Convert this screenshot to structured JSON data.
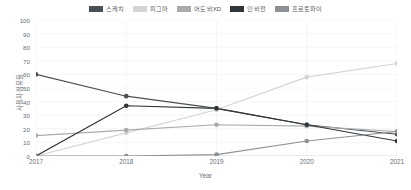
{
  "legend": {
    "position": "top-center",
    "items": [
      {
        "label": "스케치",
        "color": "#4a4f54"
      },
      {
        "label": "피그마",
        "color": "#d2d4d6"
      },
      {
        "label": "어도비XD",
        "color": "#a8acaf"
      },
      {
        "label": "인비전",
        "color": "#303539"
      },
      {
        "label": "프로토파이",
        "color": "#8d9195"
      }
    ]
  },
  "axes": {
    "x_title": "Year",
    "y_title": "사용자 점유율",
    "x_ticks": [
      "2017",
      "2018",
      "2019",
      "2020",
      "2021"
    ],
    "y_ticks": [
      "0",
      "10",
      "20",
      "30",
      "40",
      "50",
      "60",
      "70",
      "80",
      "90",
      "100"
    ]
  },
  "chart_data": {
    "type": "line",
    "title": "",
    "xlabel": "Year",
    "ylabel": "사용자 점유율",
    "x": [
      2017,
      2018,
      2019,
      2020,
      2021
    ],
    "categories": [
      "2017",
      "2018",
      "2019",
      "2020",
      "2021"
    ],
    "ylim": [
      0,
      100
    ],
    "xlim": [
      2017,
      2021
    ],
    "grid": true,
    "legend_position": "top-center",
    "series": [
      {
        "name": "스케치",
        "color": "#4a4f54",
        "values": [
          60,
          44,
          35,
          23,
          16
        ]
      },
      {
        "name": "피그마",
        "color": "#d2d4d6",
        "values": [
          0,
          17,
          34,
          58,
          68
        ]
      },
      {
        "name": "어도비XD",
        "color": "#a8acaf",
        "values": [
          15,
          19,
          23,
          22,
          18
        ]
      },
      {
        "name": "인비전",
        "color": "#303539",
        "values": [
          0,
          37,
          35,
          23,
          11
        ]
      },
      {
        "name": "프로토파이",
        "color": "#8d9195",
        "values": [
          0,
          0,
          1,
          11,
          18
        ]
      }
    ]
  }
}
